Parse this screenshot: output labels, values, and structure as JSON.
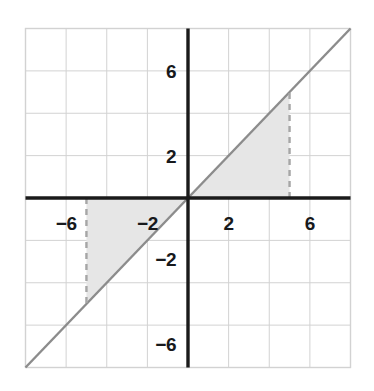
{
  "chart_data": {
    "type": "line",
    "title": "",
    "xlabel": "",
    "ylabel": "",
    "xlim": [
      -8,
      8
    ],
    "ylim": [
      -8,
      8
    ],
    "grid": true,
    "legend": null,
    "axis_color": "#1a1a1a",
    "grid_color": "#d2d2d2",
    "line_color": "#8c8c8c",
    "shade_color": "#e6e6e6",
    "dash_color": "#a6a6a6",
    "background": "#ffffff",
    "tick_step": 4,
    "grid_step": 2,
    "xticks": [
      -6,
      -2,
      2,
      6
    ],
    "xtick_labels": [
      "−6",
      "−2",
      "2",
      "6"
    ],
    "yticks": [
      -6,
      -2,
      2,
      6
    ],
    "ytick_labels": [
      "−6",
      "−2",
      "2",
      "6"
    ],
    "series": [
      {
        "name": "y = x",
        "type": "line",
        "expression": "y = x",
        "slope": 1,
        "intercept": 0,
        "x": [
          -8,
          8
        ],
        "y": [
          -8,
          8
        ],
        "color": "#8c8c8c"
      }
    ],
    "shaded_regions": [
      {
        "name": "region-quadrant-i",
        "description": "Triangle bounded by y = x, the x-axis, and the vertical line x = 5",
        "vertices": [
          [
            0,
            0
          ],
          [
            5,
            0
          ],
          [
            5,
            5
          ]
        ],
        "fill": "#e6e6e6"
      },
      {
        "name": "region-quadrant-iii",
        "description": "Triangle bounded by y = x, the x-axis, and the vertical line x = -5",
        "vertices": [
          [
            0,
            0
          ],
          [
            -5,
            0
          ],
          [
            -5,
            -5
          ]
        ],
        "fill": "#e6e6e6"
      }
    ],
    "dashed_lines": [
      {
        "name": "right-boundary",
        "x": 5,
        "y_from": 0,
        "y_to": 5
      },
      {
        "name": "left-boundary",
        "x": -5,
        "y_from": 0,
        "y_to": -5
      }
    ]
  }
}
